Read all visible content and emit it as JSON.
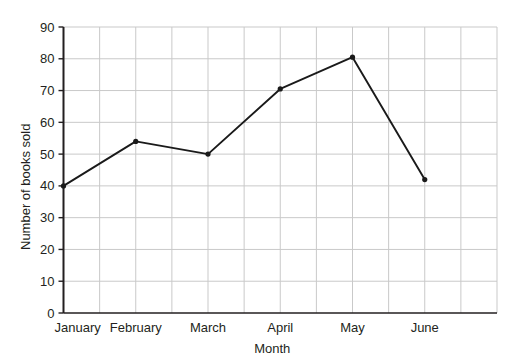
{
  "chart_data": {
    "type": "line",
    "title": "",
    "xlabel": "Month",
    "ylabel": "Number of books sold",
    "categories": [
      "January",
      "February",
      "March",
      "April",
      "May",
      "June"
    ],
    "values": [
      40,
      54,
      50,
      70.5,
      80.5,
      42
    ],
    "series": [
      {
        "name": "Number of books sold",
        "values": [
          40,
          54,
          50,
          70.5,
          80.5,
          42
        ]
      }
    ],
    "ylim": [
      0,
      90
    ],
    "y_ticks": [
      "0",
      "10",
      "20",
      "30",
      "40",
      "50",
      "60",
      "70",
      "80",
      "90"
    ],
    "y_tick_values": [
      0,
      10,
      20,
      30,
      40,
      50,
      60,
      70,
      80,
      90
    ],
    "grid": true,
    "grid_color": "#c9c9c9",
    "grid_vertical_divisions": 12,
    "legend": "none",
    "line_color": "#1a1a1a",
    "marker": "dot",
    "marker_color": "#1a1a1a",
    "axis_color": "#231f20",
    "background": "#ffffff"
  },
  "axes": {
    "y_title": "Number of books sold",
    "x_title": "Month"
  }
}
